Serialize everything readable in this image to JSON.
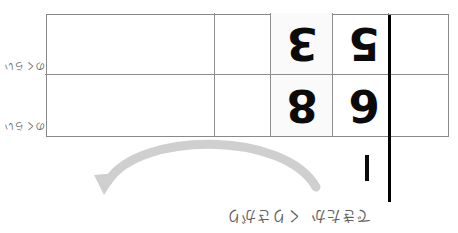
{
  "document": {
    "kind": "subtraction-vertical-calculation-worksheet",
    "orientation_note": "180-degree-rotated",
    "page_background": "#ffffff"
  },
  "grid": {
    "border_color": "#888888",
    "divider_color": "#8d8d8d",
    "shaded_cell_color": "#fafafa",
    "rows": 2,
    "columns": 5
  },
  "place_labels": {
    "tens": "十のくらい",
    "tens_ruby": "じゅう",
    "ones": "一のくらい",
    "ones_ruby": "いち"
  },
  "calculation": {
    "minuend": {
      "tens": "5",
      "ones": "3"
    },
    "subtrahend": {
      "tens": "6",
      "ones": "8"
    },
    "operator": "−",
    "digit_color": "#0b0b0b",
    "rule_color": "#000000"
  },
  "annotation": {
    "arrow": {
      "name": "borrow-arrow",
      "color": "#cccccc",
      "direction": "right-to-left"
    },
    "note_part_1": "くりさがり",
    "note_part_2": "できたか",
    "note_color": "#5f5f5f"
  }
}
